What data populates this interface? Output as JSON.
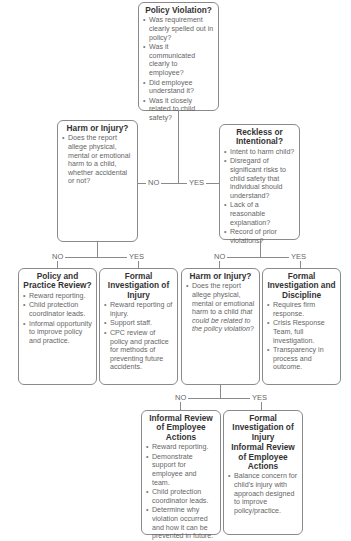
{
  "diagram": {
    "type": "decision-flowchart",
    "nodes": {
      "policy_violation": {
        "title": "Policy Violation?",
        "bullets": [
          "Was requirement clearly spelled out in policy?",
          "Was it communicated clearly to employee?",
          "Did employee understand it?",
          "Was it closely related to child safety?"
        ]
      },
      "harm_or_injury_1": {
        "title": "Harm or Injury?",
        "bullets": [
          "Does the report allege physical, mental or emotional harm to a child, whether accidental or not?"
        ]
      },
      "reckless_or_intentional": {
        "title": "Reckless or Intentional?",
        "bullets": [
          "Intent to harm child?",
          "Disregard of significant risks to child safety that individual should understand?",
          "Lack of a reasonable explanation?",
          "Record of prior violations?"
        ]
      },
      "policy_practice_review": {
        "title": "Policy and Practice Review?",
        "bullets": [
          "Reward reporting.",
          "Child protection coordinator leads.",
          "Informal opportunity to improve policy and practice."
        ]
      },
      "formal_investigation_injury": {
        "title": "Formal Investigation of Injury",
        "bullets": [
          "Reward reporting of injury.",
          "Support staff.",
          "CPC review of policy and practice for methods of preventing future accidents."
        ]
      },
      "harm_or_injury_2": {
        "title": "Harm or Injury?",
        "bullet_prefix": "Does the report allege physical, mental or emotional harm to a child ",
        "bullet_italic": "that could be related to the policy violation",
        "bullet_suffix": "?"
      },
      "formal_investigation_discipline": {
        "title": "Formal Investigation and Discipline",
        "bullets": [
          "Requires firm response.",
          "Crisis Response Team, full investigation.",
          "Transparency in process and outcome."
        ]
      },
      "informal_review": {
        "title": "Informal Review of Employee Actions",
        "bullets": [
          "Reward reporting.",
          "Demonstrate support for employee and team.",
          "Child protection coordinator leads.",
          "Determine why violation occurred and how it can be prevented in future."
        ]
      },
      "formal_injury_informal_review": {
        "title_line1": "Formal Investigation of Injury",
        "title_line2": "Informal Review of Employee Actions",
        "bullets": [
          "Balance concern for child's injury with approach designed to improve policy/practice."
        ]
      }
    },
    "edge_labels": {
      "no": "NO",
      "yes": "YES"
    },
    "edges": [
      {
        "from": "policy_violation",
        "to": "harm_or_injury_1",
        "label": "NO"
      },
      {
        "from": "policy_violation",
        "to": "reckless_or_intentional",
        "label": "YES"
      },
      {
        "from": "harm_or_injury_1",
        "to": "policy_practice_review",
        "label": "NO"
      },
      {
        "from": "harm_or_injury_1",
        "to": "formal_investigation_injury",
        "label": "YES"
      },
      {
        "from": "reckless_or_intentional",
        "to": "harm_or_injury_2",
        "label": "NO"
      },
      {
        "from": "reckless_or_intentional",
        "to": "formal_investigation_discipline",
        "label": "YES"
      },
      {
        "from": "harm_or_injury_2",
        "to": "informal_review",
        "label": "NO"
      },
      {
        "from": "harm_or_injury_2",
        "to": "formal_injury_informal_review",
        "label": "YES"
      }
    ],
    "colors": {
      "border": "#8a8a8a",
      "title_text": "#333333",
      "body_text": "#666666",
      "background": "#ffffff"
    }
  }
}
